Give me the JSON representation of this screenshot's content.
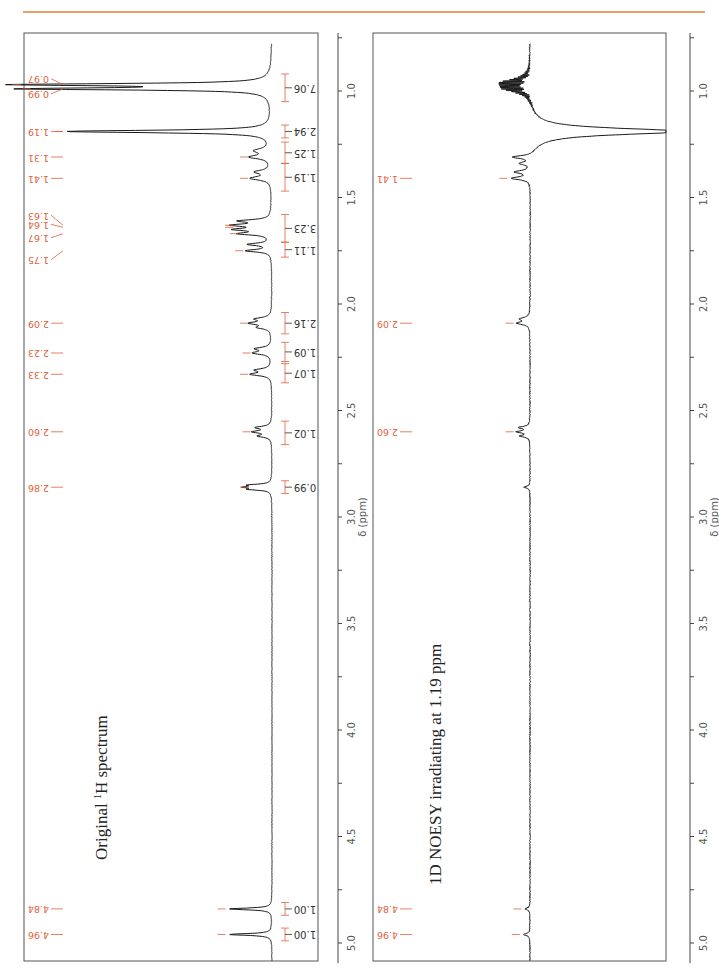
{
  "header": {
    "rule_color": "#e8a070"
  },
  "colors": {
    "spectrum": "#1a1a1a",
    "annotation": "#e0603a",
    "frame": "#555555",
    "axis": "#444444",
    "axis_text": "#555555"
  },
  "axis": {
    "label": "δ (ppm)",
    "ticks_major": [
      "1.0",
      "1.5",
      "2.0",
      "2.5",
      "3.0",
      "3.5",
      "4.0",
      "4.5",
      "5.0"
    ],
    "range_ppm": [
      0.78,
      5.2
    ]
  },
  "chart_data": [
    {
      "type": "line",
      "title": "Original 1H spectrum",
      "title_main": "Original ",
      "title_sup": "1",
      "title_rest": "H spectrum",
      "xlabel": "δ (ppm)",
      "xlim": [
        0.78,
        5.2
      ],
      "x_ticks": [
        1.0,
        1.5,
        2.0,
        2.5,
        3.0,
        3.5,
        4.0,
        4.5,
        5.0
      ],
      "orientation": "rotated 90°, ppm increases downward",
      "peak_labels": [
        "0.97",
        "0.99",
        "1.19",
        "1.31",
        "1.41",
        "1.63",
        "1.64",
        "1.67",
        "1.75",
        "2.09",
        "2.23",
        "2.33",
        "2.60",
        "2.86",
        "4.84",
        "4.96"
      ],
      "peaks_ppm": [
        0.97,
        0.99,
        1.19,
        1.31,
        1.41,
        1.63,
        1.64,
        1.67,
        1.75,
        2.09,
        2.23,
        2.33,
        2.6,
        2.86,
        4.84,
        4.96
      ],
      "integrals": [
        {
          "value": "7.06",
          "from": 0.92,
          "to": 1.05
        },
        {
          "value": "2.94",
          "from": 1.16,
          "to": 1.22
        },
        {
          "value": "1.25",
          "from": 1.24,
          "to": 1.34
        },
        {
          "value": "1.19",
          "from": 1.34,
          "to": 1.47
        },
        {
          "value": "3.23",
          "from": 1.58,
          "to": 1.71
        },
        {
          "value": "1.11",
          "from": 1.71,
          "to": 1.78
        },
        {
          "value": "2.16",
          "from": 2.04,
          "to": 2.14
        },
        {
          "value": "1.09",
          "from": 2.18,
          "to": 2.27
        },
        {
          "value": "1.07",
          "from": 2.28,
          "to": 2.37
        },
        {
          "value": "1.02",
          "from": 2.55,
          "to": 2.66
        },
        {
          "value": "0.99",
          "from": 2.83,
          "to": 2.89
        },
        {
          "value": "1.00",
          "from": 4.81,
          "to": 4.87
        },
        {
          "value": "1.00",
          "from": 4.93,
          "to": 4.99
        }
      ],
      "signals": [
        {
          "ppm": 0.97,
          "height": 0.99,
          "width": 0.006
        },
        {
          "ppm": 0.99,
          "height": 0.95,
          "width": 0.006
        },
        {
          "ppm": 1.19,
          "height": 0.82,
          "width": 0.007
        },
        {
          "ppm": 1.28,
          "height": 0.06,
          "width": 0.012
        },
        {
          "ppm": 1.31,
          "height": 0.08,
          "width": 0.01
        },
        {
          "ppm": 1.38,
          "height": 0.06,
          "width": 0.01
        },
        {
          "ppm": 1.41,
          "height": 0.08,
          "width": 0.01
        },
        {
          "ppm": 1.61,
          "height": 0.12,
          "width": 0.007
        },
        {
          "ppm": 1.63,
          "height": 0.14,
          "width": 0.007
        },
        {
          "ppm": 1.65,
          "height": 0.13,
          "width": 0.007
        },
        {
          "ppm": 1.67,
          "height": 0.12,
          "width": 0.007
        },
        {
          "ppm": 1.72,
          "height": 0.09,
          "width": 0.007
        },
        {
          "ppm": 1.75,
          "height": 0.1,
          "width": 0.007
        },
        {
          "ppm": 2.07,
          "height": 0.06,
          "width": 0.008
        },
        {
          "ppm": 2.09,
          "height": 0.08,
          "width": 0.008
        },
        {
          "ppm": 2.11,
          "height": 0.05,
          "width": 0.008
        },
        {
          "ppm": 2.21,
          "height": 0.06,
          "width": 0.008
        },
        {
          "ppm": 2.23,
          "height": 0.07,
          "width": 0.008
        },
        {
          "ppm": 2.31,
          "height": 0.06,
          "width": 0.008
        },
        {
          "ppm": 2.33,
          "height": 0.08,
          "width": 0.008
        },
        {
          "ppm": 2.58,
          "height": 0.06,
          "width": 0.007
        },
        {
          "ppm": 2.6,
          "height": 0.07,
          "width": 0.007
        },
        {
          "ppm": 2.62,
          "height": 0.05,
          "width": 0.007
        },
        {
          "ppm": 2.85,
          "height": 0.08,
          "width": 0.005
        },
        {
          "ppm": 2.86,
          "height": 0.09,
          "width": 0.005
        },
        {
          "ppm": 2.87,
          "height": 0.08,
          "width": 0.005
        },
        {
          "ppm": 4.84,
          "height": 0.17,
          "width": 0.005
        },
        {
          "ppm": 4.96,
          "height": 0.17,
          "width": 0.005
        }
      ]
    },
    {
      "type": "line",
      "title": "1D NOESY irradiating at 1.19 ppm",
      "xlabel": "δ (ppm)",
      "xlim": [
        0.78,
        5.2
      ],
      "x_ticks": [
        1.0,
        1.5,
        2.0,
        2.5,
        3.0,
        3.5,
        4.0,
        4.5,
        5.0
      ],
      "orientation": "rotated 90°, ppm increases downward",
      "peak_labels": [
        "1.41",
        "2.09",
        "2.60",
        "4.84",
        "4.96"
      ],
      "peaks_ppm": [
        1.41,
        2.09,
        2.6,
        4.84,
        4.96
      ],
      "irradiated_ppm": 1.19,
      "signals": [
        {
          "ppm": 0.96,
          "height": 0.17,
          "width": 0.006,
          "dispersive": true
        },
        {
          "ppm": 0.99,
          "height": 0.15,
          "width": 0.006,
          "dispersive": true
        },
        {
          "ppm": 1.19,
          "height": -0.99,
          "width": 0.018
        },
        {
          "ppm": 1.31,
          "height": 0.13,
          "width": 0.008
        },
        {
          "ppm": 1.34,
          "height": 0.07,
          "width": 0.008
        },
        {
          "ppm": 1.38,
          "height": 0.1,
          "width": 0.008
        },
        {
          "ppm": 1.41,
          "height": 0.12,
          "width": 0.008
        },
        {
          "ppm": 2.07,
          "height": 0.06,
          "width": 0.008
        },
        {
          "ppm": 2.09,
          "height": 0.08,
          "width": 0.008
        },
        {
          "ppm": 2.58,
          "height": 0.07,
          "width": 0.006
        },
        {
          "ppm": 2.6,
          "height": 0.08,
          "width": 0.006
        },
        {
          "ppm": 2.62,
          "height": 0.06,
          "width": 0.006
        },
        {
          "ppm": 2.86,
          "height": 0.04,
          "width": 0.005
        },
        {
          "ppm": 4.84,
          "height": 0.03,
          "width": 0.006
        },
        {
          "ppm": 4.96,
          "height": 0.04,
          "width": 0.006
        }
      ]
    }
  ]
}
